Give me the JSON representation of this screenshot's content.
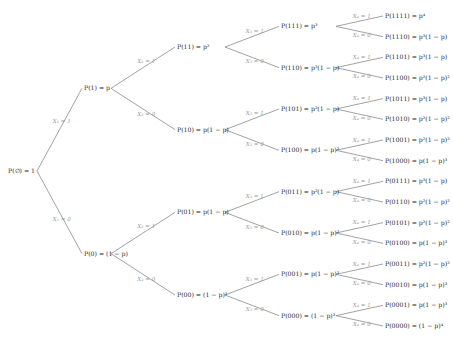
{
  "diagram": {
    "type": "probability-tree",
    "root": {
      "label": "P(∅) = 1"
    },
    "levels": [
      {
        "variable": "X1",
        "edge_labels": {
          "one": "X₁ = 1",
          "zero": "X₁ = 0"
        },
        "nodes": [
          "P(1) = p",
          "P(0) = (1 − p)"
        ]
      },
      {
        "variable": "X2",
        "edge_labels": {
          "one": "X₂ = 1",
          "zero": "X₂ = 0"
        },
        "nodes": [
          "P(11) = p²",
          "P(10) = p(1 − p)",
          "P(01) = p(1 − p)",
          "P(00) = (1 − p)²"
        ]
      },
      {
        "variable": "X3",
        "edge_labels": {
          "one": "X₃ = 1",
          "zero": "X₃ = 0"
        },
        "nodes": [
          "P(111) = p³",
          "P(110) = p²(1 − p)",
          "P(101) = p²(1 − p)",
          "P(100) = p(1 − p)²",
          "P(011) = p²(1 − p)",
          "P(010) = p(1 − p)²",
          "P(001) = p(1 − p)²",
          "P(000) = (1 − p)³"
        ]
      },
      {
        "variable": "X4",
        "edge_labels": {
          "one": "X₄ = 1",
          "zero": "X₄ = 0"
        },
        "nodes": [
          "P(1111) = p⁴",
          "P(1110) = p³(1 − p)",
          "P(1101) = p³(1 − p)",
          "P(1100) = p²(1 − p)²",
          "P(1011) = p³(1 − p)",
          "P(1010) = p²(1 − p)²",
          "P(1001) = p²(1 − p)²",
          "P(1000) = p(1 − p)³",
          "P(0111) = p³(1 − p)",
          "P(0110) = p²(1 − p)²",
          "P(0101) = p²(1 − p)²",
          "P(0100) = p(1 − p)³",
          "P(0011) = p²(1 − p)²",
          "P(0010) = p(1 − p)³",
          "P(0001) = p(1 − p)³",
          "P(0000) = (1 − p)⁴"
        ]
      }
    ],
    "colors": {
      "edge": "#8a8a8a",
      "node_text": "#2a2a2a",
      "edge_label_text": "#9a9a9a"
    }
  }
}
